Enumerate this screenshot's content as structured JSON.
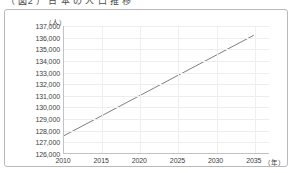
{
  "figure": {
    "title": "（ 図2 ）  日 本 の 人 口 推 移",
    "frame_border_color": "#b9b9b9",
    "background_color": "#ffffff"
  },
  "chart_data": {
    "type": "line",
    "title": "（ 図2 ）  日 本 の 人 口 推 移",
    "xlabel": "（年）",
    "ylabel": "（人）",
    "xlim": [
      2010,
      2037
    ],
    "ylim": [
      126000,
      137000
    ],
    "grid": true,
    "legend": "none",
    "line_color": "#6f6f6f",
    "x_ticks": [
      2010,
      2015,
      2020,
      2025,
      2030,
      2035
    ],
    "x_tick_labels": [
      "2010",
      "2015",
      "2020",
      "2025",
      "2030",
      "2035"
    ],
    "y_ticks": [
      126000,
      127000,
      128000,
      129000,
      130000,
      131000,
      132000,
      133000,
      134000,
      135000,
      136000,
      137000
    ],
    "y_tick_labels": [
      "126,000",
      "127,000",
      "128,000",
      "129,000",
      "130,000",
      "131,000",
      "132,000",
      "133,000",
      "134,000",
      "135,000",
      "136,000",
      "137,000"
    ],
    "series": [
      {
        "name": "人口",
        "x": [
          2010,
          2035
        ],
        "values": [
          127500,
          136200
        ]
      }
    ]
  }
}
